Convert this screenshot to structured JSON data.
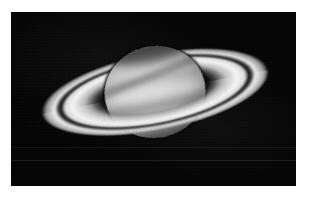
{
  "document": {
    "type": "astrophotograph",
    "subject": "Saturn",
    "rendering": "grayscale",
    "canvas": {
      "width": 309,
      "height": 198
    },
    "background_color": "#ffffff"
  },
  "photo": {
    "name": "saturn-photograph",
    "frame": {
      "left": 11,
      "top": 12,
      "width": 285,
      "height": 174
    },
    "sky_color": "#050505",
    "artifacts": [
      {
        "name": "horizontal-scanline",
        "y": 160,
        "intensity": "faint"
      },
      {
        "name": "horizontal-scanline",
        "y": 147,
        "intensity": "very-faint"
      }
    ]
  },
  "scene": {
    "center": {
      "x": 155,
      "y": 92
    },
    "ring_tilt_degrees": -11,
    "objects": [
      {
        "name": "globe",
        "label": "Saturn globe",
        "width": 101,
        "height": 91,
        "shape": "oblate-disk",
        "brightest_tone": "#d2d2d2",
        "darkest_tone": "#343434",
        "features": [
          {
            "name": "polar-hood",
            "description": "dark north polar region",
            "tone": "#3a3a3a"
          },
          {
            "name": "equatorial-zone",
            "description": "bright equatorial zone",
            "tone": "#d6d6d6"
          },
          {
            "name": "cloud-belts",
            "description": "horizontal banding across the disk"
          },
          {
            "name": "ring-shadow",
            "description": "shadow of rings cast on northern hemisphere"
          },
          {
            "name": "limb-darkening",
            "description": "darkening toward lower-left limb"
          }
        ]
      },
      {
        "name": "ring-a",
        "label": "A ring (outer)",
        "major_axis": 232,
        "minor_axis": 78,
        "tone": "#ececec"
      },
      {
        "name": "cassini-division",
        "label": "Cassini Division",
        "major_axis": 203,
        "minor_axis": 68,
        "tone": "#0c0c0c"
      },
      {
        "name": "ring-b",
        "label": "B ring (inner, brightest)",
        "major_axis": 190,
        "minor_axis": 63,
        "tone": "#f3f3f3"
      },
      {
        "name": "ring-c",
        "label": "C ring (crepe, faint)",
        "major_axis": 160,
        "minor_axis": 52,
        "tone": "#969696"
      }
    ]
  }
}
